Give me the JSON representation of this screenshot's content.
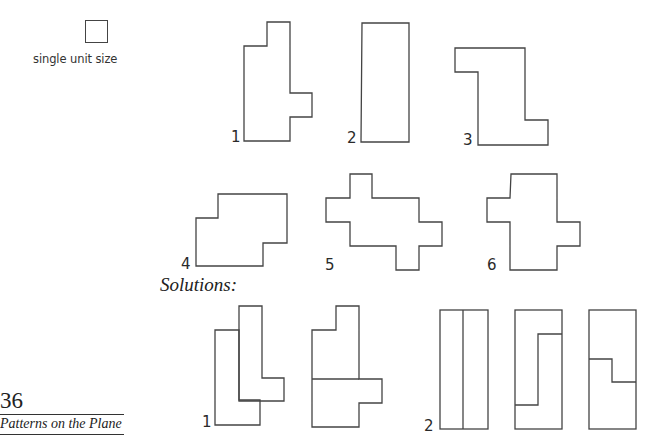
{
  "legend": {
    "unit_label": "single unit size"
  },
  "problems": {
    "labels": [
      "1",
      "2",
      "3",
      "4",
      "5",
      "6"
    ]
  },
  "solutions": {
    "heading": "Solutions:",
    "labels": [
      "1",
      "2"
    ]
  },
  "footer": {
    "page_number": "36",
    "running_title": "Patterns on the Plane"
  },
  "colors": {
    "stroke": "#444444",
    "background": "#ffffff"
  }
}
